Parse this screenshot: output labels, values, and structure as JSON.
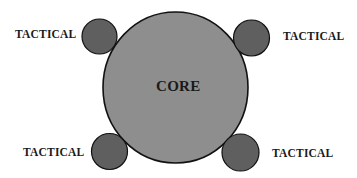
{
  "diagram": {
    "core": {
      "label": "CORE",
      "fill": "#8e8e8e",
      "stroke": "#111111"
    },
    "satellites": [
      {
        "position": "top-left",
        "label": "TACTICAL"
      },
      {
        "position": "top-right",
        "label": "TACTICAL"
      },
      {
        "position": "bottom-left",
        "label": "TACTICAL"
      },
      {
        "position": "bottom-right",
        "label": "TACTICAL"
      }
    ],
    "satellite_fill": "#5f5f5f",
    "satellite_stroke": "#111111"
  }
}
